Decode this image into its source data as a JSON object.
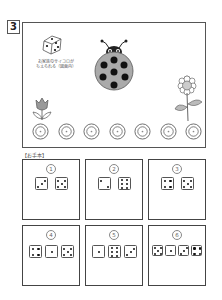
{
  "question": {
    "number": "3"
  },
  "scene": {
    "caption_line1": "お家族のサイコロが",
    "caption_line2": "ちえられる（図面内）",
    "stepping_stones": 7,
    "stone_label": "●"
  },
  "examples": {
    "label": "【お手本】",
    "cards": [
      {
        "num": "1",
        "dice": [
          3,
          5
        ]
      },
      {
        "num": "2",
        "dice": [
          2,
          6
        ]
      },
      {
        "num": "3",
        "dice": [
          4,
          5
        ]
      },
      {
        "num": "4",
        "dice": [
          4,
          1,
          5
        ]
      },
      {
        "num": "5",
        "dice": [
          1,
          6,
          3
        ]
      },
      {
        "num": "6",
        "dice": [
          5,
          1,
          3,
          4
        ]
      }
    ]
  }
}
